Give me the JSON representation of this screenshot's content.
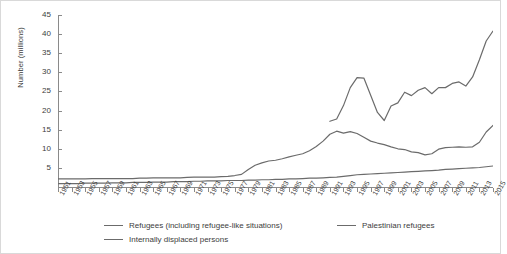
{
  "axes": {
    "ylabel": "Number (millions)",
    "yticks": [
      5,
      10,
      15,
      20,
      25,
      30,
      35,
      40,
      45
    ],
    "xticks": [
      "1951",
      "1953",
      "1955",
      "1957",
      "1959",
      "1961",
      "1963",
      "1965",
      "1967",
      "1969",
      "1971",
      "1973",
      "1975",
      "1977",
      "1979",
      "1981",
      "1983",
      "1985",
      "1987",
      "1989",
      "1991",
      "1993",
      "1995",
      "1997",
      "1999",
      "2001",
      "2003",
      "2005",
      "2007",
      "2009",
      "2011",
      "2013",
      "2015"
    ]
  },
  "legend": {
    "refugees_label": "Refugees (including refugee-like situations)",
    "palestinian_label": "Palestinian refugees",
    "idp_label": "Internally displaced persons"
  },
  "colors": {
    "line": "#6b6b6b",
    "axis": "#8a8a8a",
    "text": "#3d3d3d",
    "border": "#d9d9d9"
  },
  "chart_data": {
    "type": "line",
    "title": "",
    "xlabel": "",
    "ylabel": "Number (millions)",
    "xlim": [
      1951,
      2015
    ],
    "ylim": [
      0,
      45
    ],
    "grid": false,
    "legend_position": "bottom",
    "x": [
      1951,
      1952,
      1953,
      1954,
      1955,
      1956,
      1957,
      1958,
      1959,
      1960,
      1961,
      1962,
      1963,
      1964,
      1965,
      1966,
      1967,
      1968,
      1969,
      1970,
      1971,
      1972,
      1973,
      1974,
      1975,
      1976,
      1977,
      1978,
      1979,
      1980,
      1981,
      1982,
      1983,
      1984,
      1985,
      1986,
      1987,
      1988,
      1989,
      1990,
      1991,
      1992,
      1993,
      1994,
      1995,
      1996,
      1997,
      1998,
      1999,
      2000,
      2001,
      2002,
      2003,
      2004,
      2005,
      2006,
      2007,
      2008,
      2009,
      2010,
      2011,
      2012,
      2013,
      2014,
      2015
    ],
    "series": [
      {
        "name": "Refugees (including refugee-like situations)",
        "values": [
          2.1,
          2.1,
          2.1,
          2.1,
          2.1,
          2.2,
          2.2,
          2.2,
          2.2,
          2.2,
          2.2,
          2.2,
          2.3,
          2.3,
          2.4,
          2.4,
          2.4,
          2.4,
          2.4,
          2.5,
          2.6,
          2.6,
          2.6,
          2.6,
          2.7,
          2.8,
          3.0,
          3.3,
          4.6,
          5.7,
          6.3,
          6.8,
          7.0,
          7.4,
          7.9,
          8.3,
          8.7,
          9.5,
          10.6,
          12.0,
          13.8,
          14.6,
          14.1,
          14.5,
          14.0,
          13.0,
          12.0,
          11.5,
          11.1,
          10.5,
          10.0,
          9.8,
          9.2,
          9.0,
          8.4,
          8.7,
          9.9,
          10.3,
          10.4,
          10.5,
          10.4,
          10.5,
          11.7,
          14.4,
          16.1
        ]
      },
      {
        "name": "Palestinian refugees",
        "values": [
          0.9,
          0.9,
          0.9,
          0.9,
          1.0,
          1.0,
          1.0,
          1.0,
          1.1,
          1.1,
          1.1,
          1.2,
          1.2,
          1.2,
          1.3,
          1.3,
          1.3,
          1.4,
          1.4,
          1.4,
          1.5,
          1.5,
          1.6,
          1.6,
          1.6,
          1.7,
          1.7,
          1.7,
          1.8,
          1.8,
          1.9,
          1.9,
          2.0,
          2.0,
          2.1,
          2.1,
          2.2,
          2.3,
          2.3,
          2.4,
          2.5,
          2.6,
          2.8,
          3.0,
          3.2,
          3.3,
          3.4,
          3.5,
          3.6,
          3.7,
          3.8,
          3.9,
          4.0,
          4.1,
          4.2,
          4.3,
          4.4,
          4.6,
          4.7,
          4.8,
          4.9,
          5.0,
          5.1,
          5.3,
          5.5
        ]
      },
      {
        "name": "Internally displaced persons",
        "values": [
          0.0,
          0.0,
          0.0,
          0.0,
          0.0,
          0.0,
          0.0,
          0.0,
          0.0,
          0.0,
          0.0,
          0.0,
          0.0,
          0.0,
          0.0,
          0.0,
          0.0,
          0.0,
          0.0,
          0.0,
          0.0,
          0.0,
          0.0,
          0.0,
          0.0,
          0.0,
          0.0,
          0.0,
          0.0,
          0.0,
          0.0,
          0.0,
          0.0,
          0.0,
          0.0,
          0.0,
          0.0,
          0.0,
          0.0,
          0.0,
          17.2,
          17.8,
          21.3,
          26.0,
          28.6,
          28.5,
          24.0,
          19.5,
          17.4,
          21.2,
          22.0,
          24.8,
          23.9,
          25.3,
          26.0,
          24.4,
          26.0,
          26.0,
          27.1,
          27.5,
          26.4,
          28.8,
          33.3,
          38.2,
          40.8
        ]
      }
    ]
  }
}
